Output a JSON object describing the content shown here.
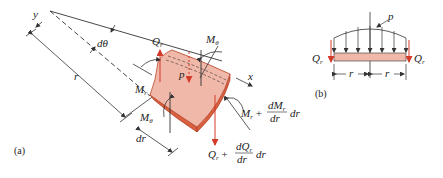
{
  "figure_a": {
    "caption": "(a)",
    "labels": {
      "y_axis": "y",
      "x_axis": "x",
      "d_theta": "dθ",
      "radius": "r",
      "Q_r": "Q",
      "Q_r_sub": "r",
      "M_theta_top": "M",
      "M_theta_top_sub": "θ",
      "M_r": "M",
      "M_r_sub": "r",
      "p": "p",
      "M_theta_left": "M",
      "M_theta_left_sub": "θ",
      "dr": "dr",
      "M_r_plus_base": "M",
      "M_r_plus_sub": "r",
      "M_r_plus_op": "+",
      "M_r_plus_num": "dM",
      "M_r_plus_num_sub": "r",
      "M_r_plus_den": "dr",
      "M_r_plus_tail": "dr",
      "Q_r_plus_base": "Q",
      "Q_r_plus_sub": "r",
      "Q_r_plus_op": "+",
      "Q_r_plus_num": "dQ",
      "Q_r_plus_num_sub": "r",
      "Q_r_plus_den": "dr",
      "Q_r_plus_tail": "dr"
    }
  },
  "figure_b": {
    "caption": "(b)",
    "labels": {
      "p": "p",
      "Q_left": "Q",
      "Q_left_sub": "r",
      "Q_right": "Q",
      "Q_right_sub": "r",
      "r_left": "r",
      "r_right": "r"
    }
  },
  "colors": {
    "element_fill": "#f0b8a8",
    "element_edge": "#c8442a",
    "element_side": "#d9603f",
    "force_arrow": "#d23a2a",
    "line": "#333333"
  }
}
